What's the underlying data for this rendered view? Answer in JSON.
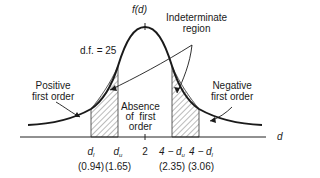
{
  "diagram": {
    "y_label": "f(d)",
    "x_label": "d",
    "df_label": "d.f. = 25",
    "regions": {
      "positive": [
        "Positive",
        "first order"
      ],
      "negative": [
        "Negative",
        "first order"
      ],
      "indeterminate": [
        "Indeterminate",
        "region"
      ],
      "absence": [
        "Absence",
        "of  first",
        "order"
      ]
    },
    "ticks": [
      {
        "symbol": "d",
        "sub": "l",
        "value": "(0.94)"
      },
      {
        "symbol": "d",
        "sub": "u",
        "value": "(1.65)"
      },
      {
        "symbol": "2",
        "sub": "",
        "value": ""
      },
      {
        "symbol": "4 − d",
        "sub": "u",
        "value": "(2.35)"
      },
      {
        "symbol": "4 − d",
        "sub": "l",
        "value": "(3.06)"
      }
    ]
  }
}
